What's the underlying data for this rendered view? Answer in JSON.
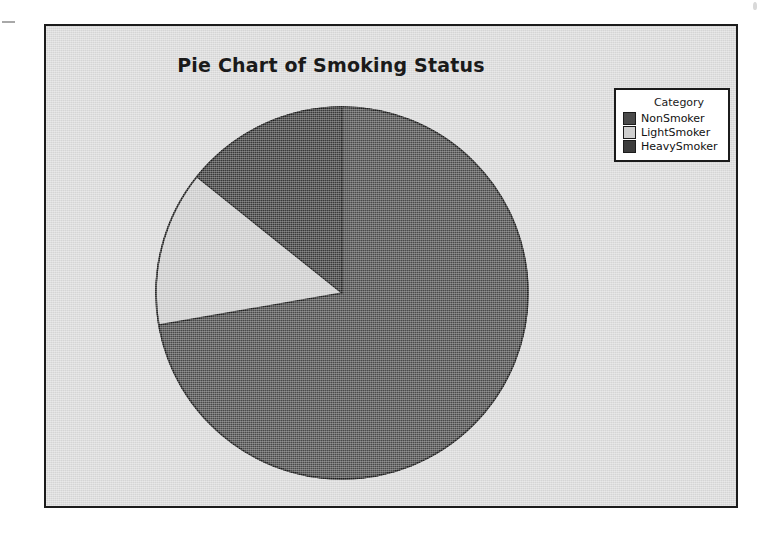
{
  "chart_data": {
    "type": "pie",
    "title": "Pie Chart of Smoking Status",
    "legend_title": "Category",
    "legend_position": "top-right",
    "categories": [
      "NonSmoker",
      "LightSmoker",
      "HeavySmoker"
    ],
    "values": [
      72.3,
      13.5,
      14.2
    ],
    "units": "percent",
    "start_angle_deg": 0,
    "direction": "clockwise",
    "slices": [
      {
        "label": "NonSmoker",
        "value": 72.3,
        "start_angle_deg": 0.0,
        "end_angle_deg": 260.1,
        "color": "#4b4b4b"
      },
      {
        "label": "LightSmoker",
        "value": 13.5,
        "start_angle_deg": 260.1,
        "end_angle_deg": 308.7,
        "color": "#cfcfcf"
      },
      {
        "label": "HeavySmoker",
        "value": 14.2,
        "start_angle_deg": 308.7,
        "end_angle_deg": 360.0,
        "color": "#3c3c3c"
      }
    ],
    "xlabel": "",
    "ylabel": "",
    "grid": false
  },
  "frame": {
    "background_color": "#dcdcdc",
    "border_color": "#1c1c1c"
  },
  "legend": {
    "title": "Category",
    "items": [
      {
        "label": "NonSmoker",
        "color": "#4b4b4b"
      },
      {
        "label": "LightSmoker",
        "color": "#cfcfcf"
      },
      {
        "label": "HeavySmoker",
        "color": "#3c3c3c"
      }
    ]
  }
}
